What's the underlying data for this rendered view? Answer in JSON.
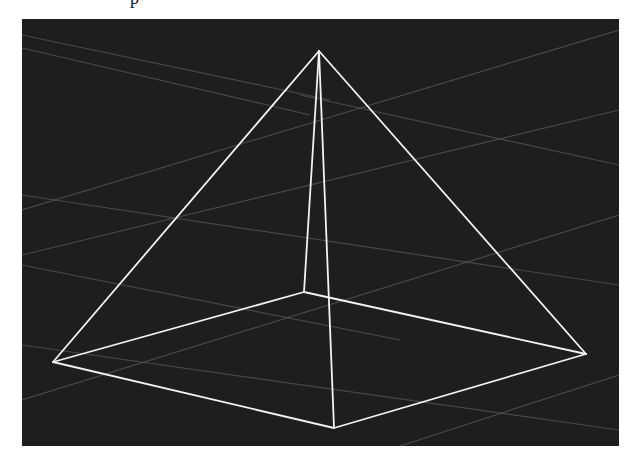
{
  "figure": {
    "caption_fragment": "p",
    "viewport": {
      "background": "#1e1e1e",
      "x": 22,
      "y": 19,
      "width": 597,
      "height": 427
    },
    "wireframe": {
      "object": "pyramid",
      "edge_color": "#f2f2f2",
      "vertices": {
        "apex": [
          319,
          51
        ],
        "base_left": [
          53,
          362
        ],
        "base_back": [
          304,
          292
        ],
        "base_right": [
          586,
          354
        ],
        "base_front": [
          334,
          428
        ]
      },
      "edges": [
        [
          "apex",
          "base_left"
        ],
        [
          "apex",
          "base_back"
        ],
        [
          "apex",
          "base_right"
        ],
        [
          "apex",
          "base_front"
        ],
        [
          "base_left",
          "base_back"
        ],
        [
          "base_back",
          "base_right"
        ],
        [
          "base_right",
          "base_front"
        ],
        [
          "base_front",
          "base_left"
        ]
      ]
    },
    "grid": {
      "line_color": "#5a5a5a",
      "lines": [
        [
          [
            22,
            35
          ],
          [
            330,
            100
          ]
        ],
        [
          [
            22,
            48
          ],
          [
            310,
            115
          ]
        ],
        [
          [
            300,
            95
          ],
          [
            619,
            165
          ]
        ],
        [
          [
            22,
            210
          ],
          [
            619,
            30
          ]
        ],
        [
          [
            22,
            255
          ],
          [
            619,
            110
          ]
        ],
        [
          [
            22,
            195
          ],
          [
            619,
            285
          ]
        ],
        [
          [
            22,
            400
          ],
          [
            619,
            215
          ]
        ],
        [
          [
            22,
            345
          ],
          [
            619,
            430
          ]
        ],
        [
          [
            400,
            446
          ],
          [
            619,
            375
          ]
        ],
        [
          [
            22,
            265
          ],
          [
            400,
            340
          ]
        ]
      ]
    }
  }
}
